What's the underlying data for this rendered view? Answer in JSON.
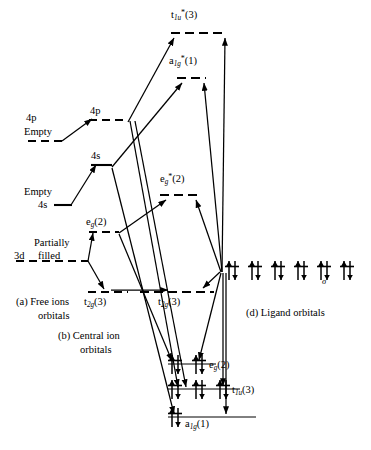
{
  "figure": {
    "type": "molecular-orbital-energy-level-diagram"
  },
  "captions": {
    "a": "(a)  Free ions",
    "a2": "orbitals",
    "b": "(b)  Central ion",
    "b2": "orbitals",
    "d": "(d)  Ligand orbitals"
  },
  "free_ion_levels": [
    {
      "id": "4p",
      "label": "4p",
      "note": "Empty",
      "note_pos": "below",
      "x": 28,
      "y": 141,
      "w": 32
    },
    {
      "id": "4s",
      "label": "4s",
      "note": "Empty",
      "note_pos": "above",
      "x": 53,
      "y": 205,
      "w": 18
    },
    {
      "id": "3d",
      "label": "3d",
      "note": "Partially filled",
      "note_pos": "inline",
      "x": 18,
      "y": 260,
      "w": 70
    }
  ],
  "central_ion_levels": [
    {
      "id": "4p",
      "label": "4p",
      "x": 88,
      "y": 120,
      "w": 40
    },
    {
      "id": "4s",
      "label": "4s",
      "x": 90,
      "y": 165,
      "w": 22
    },
    {
      "id": "eg",
      "label": "eg(2)",
      "x": 88,
      "y": 232,
      "w": 30
    },
    {
      "id": "t2g",
      "label": "t2g(3)",
      "x": 88,
      "y": 291,
      "w": 38
    }
  ],
  "mo_levels": [
    {
      "id": "t1u_star",
      "label": "t1u*(3)",
      "x": 170,
      "y": 33,
      "w": 55,
      "kind": "antibonding"
    },
    {
      "id": "a1g_star",
      "label": "a1g*(1)",
      "x": 176,
      "y": 77,
      "w": 28,
      "kind": "antibonding"
    },
    {
      "id": "eg_star",
      "label": "eg*(2)",
      "x": 160,
      "y": 194,
      "w": 38,
      "kind": "antibonding"
    },
    {
      "id": "t2g_nb",
      "label": "t2g(3)",
      "x": 140,
      "y": 291,
      "w": 75,
      "kind": "nonbonding"
    },
    {
      "id": "eg_b",
      "label": "eg(2)",
      "x": 168,
      "y": 364,
      "w": 48,
      "kind": "bonding",
      "electron_pairs": 2
    },
    {
      "id": "t1u_b",
      "label": "t1u(3)",
      "x": 168,
      "y": 389,
      "w": 72,
      "kind": "bonding",
      "electron_pairs": 3
    },
    {
      "id": "a1g_b",
      "label": "a1g(1)",
      "x": 168,
      "y": 416,
      "w": 88,
      "kind": "bonding",
      "electron_pairs": 1
    }
  ],
  "ligand_orbitals": {
    "label": "sigma",
    "sigma_symbol": "σ",
    "count": 6,
    "electron_pairs": 6,
    "y": 270,
    "x_start": 226,
    "spacing": 23
  },
  "labels": {
    "t1u_star": {
      "base": "t",
      "sub": "1u",
      "sup": "*",
      "tail": "(3)"
    },
    "a1g_star": {
      "base": "a",
      "sub": "1g",
      "sup": "*",
      "tail": "(1)"
    },
    "eg_star": {
      "base": "e",
      "sub": "g",
      "sup": "*",
      "tail": "(2)"
    },
    "eg": {
      "base": "e",
      "sub": "g",
      "sup": "",
      "tail": "(2)"
    },
    "t2g": {
      "base": "t",
      "sub": "2g",
      "sup": "",
      "tail": "(3)"
    },
    "t1u": {
      "base": "t",
      "sub": "1u",
      "sup": "",
      "tail": "(3)"
    },
    "a1g": {
      "base": "a",
      "sub": "1g",
      "sup": "",
      "tail": "(1)"
    },
    "p4": "4p",
    "s4": "4s",
    "d3": "3d",
    "empty": "Empty",
    "partially": "Partially",
    "filled": "filled"
  },
  "colors": {
    "ink": "#000000",
    "paper": "#ffffff",
    "rule": "#6e6e6e"
  }
}
